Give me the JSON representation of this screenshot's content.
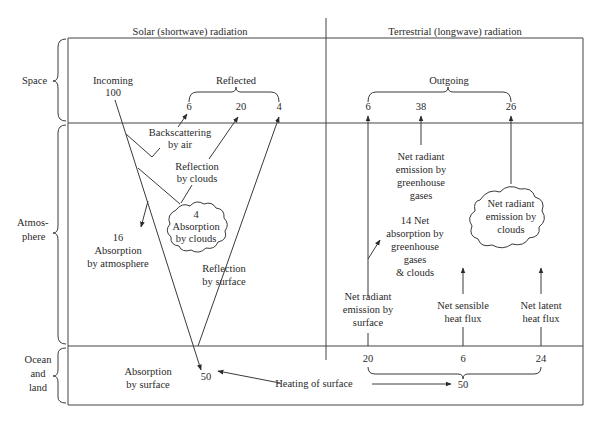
{
  "diagram": {
    "columns": {
      "solar": "Solar (shortwave) radiation",
      "terrestrial": "Terrestrial (longwave) radiation"
    },
    "layers": {
      "space": "Space",
      "atmosphere": [
        "Atmos-",
        "phere"
      ],
      "surface": [
        "Ocean",
        "and",
        "land"
      ]
    },
    "solar": {
      "incoming": {
        "label": "Incoming",
        "value": "100"
      },
      "reflected": {
        "label": "Reflected",
        "values": [
          "6",
          "20",
          "4"
        ]
      },
      "backscattering": [
        "Backscattering",
        "by air"
      ],
      "reflection_clouds": [
        "Reflection",
        "by clouds"
      ],
      "cloud_absorption": {
        "value": "4",
        "lines": [
          "Absorption",
          "by clouds"
        ]
      },
      "atmosphere_absorption": {
        "value": "16",
        "lines": [
          "Absorption",
          "by atmosphere"
        ]
      },
      "reflection_surface": [
        "Reflection",
        "by surface"
      ],
      "surface_absorption": {
        "lines": [
          "Absorption",
          "by surface"
        ],
        "value": "50"
      }
    },
    "terrestrial": {
      "outgoing": {
        "label": "Outgoing",
        "values": [
          "6",
          "38",
          "26"
        ]
      },
      "ghg_emission": [
        "Net radiant",
        "emission by",
        "greenhouse",
        "gases"
      ],
      "cloud_emission": [
        "Net radiant",
        "emission by",
        "clouds"
      ],
      "net_absorption": [
        "14 Net",
        "absorption by",
        "greenhouse",
        "gases",
        "& clouds"
      ],
      "surface_emission": [
        "Net radiant",
        "emission by",
        "surface"
      ],
      "sensible_heat": [
        "Net sensible",
        "heat flux"
      ],
      "latent_heat": [
        "Net latent",
        "heat flux"
      ],
      "surface_values": [
        "20",
        "6",
        "24"
      ],
      "total": "50",
      "heating_label": "Heating of surface"
    },
    "colors": {
      "line": "#3a3a3a",
      "text": "#2a2a2a",
      "background": "#ffffff"
    }
  }
}
